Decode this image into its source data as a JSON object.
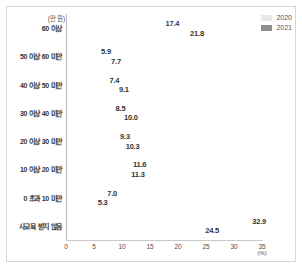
{
  "chart_data": {
    "type": "bar",
    "orientation": "horizontal",
    "title": "",
    "xlabel": "(%)",
    "ylabel": "(만 원)",
    "xlim": [
      0,
      35
    ],
    "xticks": [
      "0",
      "5",
      "10",
      "15",
      "20",
      "25",
      "30",
      "35"
    ],
    "grid": false,
    "legend_position": "top-right",
    "categories": [
      "60 이상",
      "50 이상 60 미만",
      "40 이상 50 미만",
      "30 이상 40 미만",
      "20 이상 30 미만",
      "10 이상 20 미만",
      "0 초과 10 미만",
      "사교육 받지 않음"
    ],
    "series": [
      {
        "name": "2020",
        "color": "#e9e9e9",
        "values": [
          17.4,
          5.9,
          7.4,
          8.5,
          9.3,
          11.6,
          7.0,
          32.9
        ]
      },
      {
        "name": "2021",
        "color": "#8e8e8e",
        "values": [
          21.8,
          7.7,
          9.1,
          10.0,
          10.3,
          11.3,
          5.3,
          24.5
        ]
      }
    ],
    "value_labels": {
      "2020": [
        "17.4",
        "5.9",
        "7.4",
        "8.5",
        "9.3",
        "11.6",
        "7.0",
        "32.9"
      ],
      "2021": [
        "21.8",
        "7.7",
        "9.1",
        "10.0",
        "10.3",
        "11.3",
        "5.3",
        "24.5"
      ]
    }
  },
  "legend": [
    {
      "label": "2020",
      "color": "#e9e9e9"
    },
    {
      "label": "2021",
      "color": "#8e8e8e"
    }
  ],
  "axis": {
    "unit_y": "(만 원)",
    "unit_x": "(%)"
  }
}
